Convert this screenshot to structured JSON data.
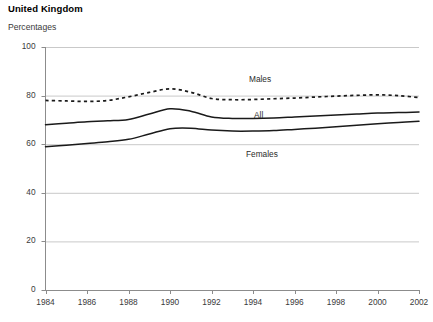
{
  "chart_data": {
    "type": "line",
    "title": "United Kingdom",
    "subtitle": "Percentages",
    "xlabel": "",
    "ylabel": "Percentages",
    "xlim": [
      1984,
      2002
    ],
    "ylim": [
      0,
      100
    ],
    "grid": true,
    "legend_position": "inline-annotations",
    "xticks": [
      "1984",
      "1986",
      "1988",
      "1990",
      "1992",
      "1994",
      "1996",
      "1998",
      "2000",
      "2002"
    ],
    "yticks": [
      "0",
      "20",
      "40",
      "60",
      "80",
      "100"
    ],
    "x": [
      1984,
      1985,
      1986,
      1987,
      1988,
      1989,
      1990,
      1991,
      1992,
      1993,
      1994,
      1995,
      1996,
      1997,
      1998,
      1999,
      2000,
      2001,
      2002
    ],
    "series": [
      {
        "name": "Males",
        "style": "dotted",
        "color": "#1a1a1a",
        "values": [
          78.0,
          77.8,
          77.6,
          78.0,
          79.5,
          81.3,
          82.8,
          81.4,
          78.8,
          78.3,
          78.4,
          78.7,
          79.0,
          79.4,
          79.8,
          80.1,
          80.3,
          80.0,
          79.2
        ]
      },
      {
        "name": "All",
        "style": "solid",
        "color": "#1a1a1a",
        "values": [
          68.0,
          68.6,
          69.2,
          69.6,
          70.2,
          72.4,
          74.6,
          73.6,
          71.2,
          70.6,
          70.6,
          70.8,
          71.2,
          71.6,
          72.0,
          72.4,
          72.8,
          73.0,
          73.2
        ]
      },
      {
        "name": "Females",
        "style": "solid",
        "color": "#1a1a1a",
        "values": [
          59.0,
          59.6,
          60.3,
          61.0,
          62.0,
          64.2,
          66.4,
          66.6,
          65.8,
          65.4,
          65.4,
          65.6,
          66.1,
          66.6,
          67.2,
          67.8,
          68.4,
          68.9,
          69.4
        ]
      }
    ]
  },
  "annotations": {
    "males_label": "Males",
    "all_label": "All",
    "females_label": "Females"
  }
}
